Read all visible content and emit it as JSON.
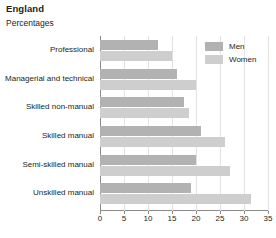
{
  "header": {
    "title": "England",
    "subtitle": "Percentages"
  },
  "legend": {
    "items": [
      {
        "label": "Men",
        "color": "#b2b2b2",
        "key": "men"
      },
      {
        "label": "Women",
        "color": "#cecece",
        "key": "women"
      }
    ]
  },
  "axis": {
    "ticks": [
      "0",
      "5",
      "10",
      "15",
      "20",
      "25",
      "30",
      "35"
    ]
  },
  "chart_data": {
    "type": "bar",
    "orientation": "horizontal",
    "title": "England",
    "subtitle": "Percentages",
    "xlabel": "",
    "ylabel": "",
    "xlim": [
      0,
      35
    ],
    "xticks": [
      0,
      5,
      10,
      15,
      20,
      25,
      30,
      35
    ],
    "grid": true,
    "legend_position": "top-right",
    "categories": [
      "Professional",
      "Managerial and technical",
      "Skilled non-manual",
      "Skilled manual",
      "Semi-skilled manual",
      "Unskilled manual"
    ],
    "series": [
      {
        "name": "Men",
        "color": "#b2b2b2",
        "values": [
          12,
          16,
          17.5,
          21,
          20,
          19
        ]
      },
      {
        "name": "Women",
        "color": "#cecece",
        "values": [
          15,
          20,
          18.5,
          26,
          27,
          31.5
        ]
      }
    ]
  }
}
